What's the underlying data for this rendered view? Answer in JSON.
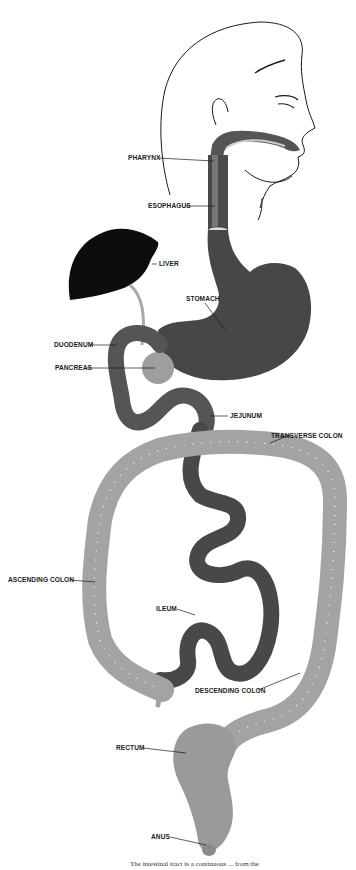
{
  "diagram": {
    "colors": {
      "outline": "#1a1a1a",
      "liver": "#0d0d0d",
      "stomach": "#474747",
      "small_intestine": "#4a4a4a",
      "duodenum": "#5a5a5a",
      "pancreas": "#9e9e9e",
      "colon": "#a3a3a3",
      "colon_haustra": "#ffffff",
      "rectum": "#9a9a9a"
    },
    "labels": [
      {
        "id": "pharynx",
        "text": "PHARYNX",
        "x": 128,
        "y": 154
      },
      {
        "id": "esophagus",
        "text": "ESOPHAGUS",
        "x": 148,
        "y": 201
      },
      {
        "id": "liver",
        "text": "LIVER",
        "x": 159,
        "y": 260
      },
      {
        "id": "stomach",
        "text": "STOMACH",
        "x": 186,
        "y": 295
      },
      {
        "id": "duodenum",
        "text": "DUODENUM",
        "x": 54,
        "y": 340
      },
      {
        "id": "pancreas",
        "text": "PANCREAS",
        "x": 55,
        "y": 363
      },
      {
        "id": "jejunum",
        "text": "JEJUNUM",
        "x": 230,
        "y": 411
      },
      {
        "id": "transverse_colon",
        "text": "TRANSVERSE  COLON",
        "x": 271,
        "y": 431
      },
      {
        "id": "ascending_colon",
        "text": "ASCENDING  COLON",
        "x": 8,
        "y": 575
      },
      {
        "id": "ileum",
        "text": "ILEUM",
        "x": 156,
        "y": 604
      },
      {
        "id": "descending_colon",
        "text": "DESCENDING  COLON",
        "x": 195,
        "y": 686
      },
      {
        "id": "rectum",
        "text": "RECTUM",
        "x": 116,
        "y": 743
      },
      {
        "id": "anus",
        "text": "ANUS",
        "x": 151,
        "y": 832
      }
    ],
    "caption": "The intestinal tract is a continuous ... from the"
  }
}
